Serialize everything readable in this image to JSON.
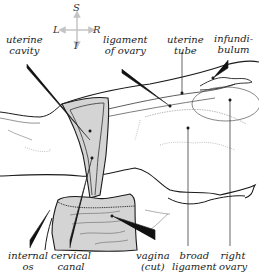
{
  "compass": {
    "superior": "S",
    "inferior": "I",
    "left": "L",
    "right": "R"
  },
  "labels": {
    "uterine_cavity": [
      "uterine",
      "cavity"
    ],
    "ligament_of_ovary": [
      "ligament",
      "of ovary"
    ],
    "uterine_tube": [
      "uterine",
      "tube"
    ],
    "infundibulum": [
      "infundi-",
      "bulum"
    ],
    "internal_os": [
      "internal",
      "os"
    ],
    "cervical_canal": [
      "cervical",
      "canal"
    ],
    "vagina": [
      "vagina",
      "(cut)"
    ],
    "broad_ligament": [
      "broad",
      "ligament"
    ],
    "right_ovary": [
      "right",
      "ovary"
    ]
  },
  "colors": {
    "tissue_fill": "#d4d4d4",
    "outline": "#1a1a1a",
    "leader": "#222222",
    "compass": "#b8b8b8"
  }
}
